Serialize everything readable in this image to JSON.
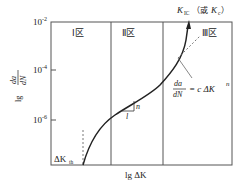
{
  "diagram": {
    "y_axis": {
      "label_num": "da",
      "label_den": "dN",
      "label_prefix": "lg",
      "ticks": [
        {
          "label": "10",
          "exp": "-2"
        },
        {
          "label": "10",
          "exp": "-4"
        },
        {
          "label": "10",
          "exp": "-6"
        }
      ]
    },
    "x_axis": {
      "label": "lg ΔK"
    },
    "regions": [
      {
        "label": "Ⅰ区"
      },
      {
        "label": "Ⅱ区"
      },
      {
        "label": "Ⅲ区"
      }
    ],
    "annotations": {
      "kic_main": "K",
      "kic_sub": "IC",
      "kic_alt_open": "（或",
      "kic_alt_main": "K",
      "kic_alt_sub": "c",
      "kic_alt_close": "）",
      "threshold_main": "ΔK",
      "threshold_sub": "th",
      "paris_num": "da",
      "paris_den": "dN",
      "paris_rhs": "= c ΔK",
      "paris_exp": "n",
      "slope_rise": "n",
      "slope_run": "l"
    },
    "colors": {
      "line": "#222222",
      "frame": "#555555",
      "dashed": "#555555"
    }
  }
}
